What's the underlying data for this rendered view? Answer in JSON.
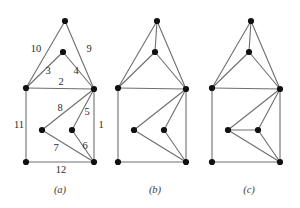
{
  "figure": {
    "type": "diagram",
    "background": "#ffffff",
    "edge_color": "#6e6e6e",
    "node_color": "#111111",
    "label_color": "#2b2b2b",
    "width": 300,
    "height": 208
  },
  "panels": [
    {
      "caption": "(a)",
      "caption_x": 60,
      "caption_y": 193,
      "origin_x": 0,
      "vertices": [
        {
          "name": "apex",
          "x": 65,
          "y": 21
        },
        {
          "name": "inner-top",
          "x": 63,
          "y": 52
        },
        {
          "name": "square-tl",
          "x": 26,
          "y": 88
        },
        {
          "name": "square-tr",
          "x": 94,
          "y": 89
        },
        {
          "name": "inner-left",
          "x": 42,
          "y": 130
        },
        {
          "name": "inner-right",
          "x": 72,
          "y": 130
        },
        {
          "name": "square-bl",
          "x": 26,
          "y": 162
        },
        {
          "name": "square-br",
          "x": 94,
          "y": 162
        }
      ],
      "edges": [
        {
          "from": "apex",
          "to": "square-tl",
          "label": "10",
          "lx": 36,
          "ly": 50
        },
        {
          "from": "apex",
          "to": "square-tr",
          "label": "9",
          "lx": 89,
          "ly": 50
        },
        {
          "from": "inner-top",
          "to": "square-tl",
          "label": "3",
          "lx": 48,
          "ly": 72
        },
        {
          "from": "inner-top",
          "to": "square-tr",
          "label": "4",
          "lx": 76,
          "ly": 72
        },
        {
          "from": "square-tl",
          "to": "square-tr",
          "label": "2",
          "lx": 61,
          "ly": 83
        },
        {
          "from": "square-tl",
          "to": "square-bl",
          "label": "11",
          "lx": 19,
          "ly": 126
        },
        {
          "from": "square-tr",
          "to": "square-br",
          "label": "1",
          "lx": 101,
          "ly": 126
        },
        {
          "from": "square-bl",
          "to": "square-br",
          "label": "12",
          "lx": 61,
          "ly": 171
        },
        {
          "from": "square-tr",
          "to": "inner-left",
          "label": "8",
          "lx": 60,
          "ly": 109
        },
        {
          "from": "square-tr",
          "to": "inner-right",
          "label": "5",
          "lx": 87,
          "ly": 113
        },
        {
          "from": "square-br",
          "to": "inner-right",
          "label": "6",
          "lx": 85,
          "ly": 147
        },
        {
          "from": "square-br",
          "to": "inner-left",
          "label": "7",
          "lx": 56,
          "ly": 149
        }
      ]
    },
    {
      "caption": "(b)",
      "caption_x": 155,
      "caption_y": 193,
      "origin_x": 92,
      "vertices": [
        {
          "name": "apex",
          "x": 65,
          "y": 21
        },
        {
          "name": "inner-top",
          "x": 63,
          "y": 52
        },
        {
          "name": "square-tl",
          "x": 26,
          "y": 88
        },
        {
          "name": "square-tr",
          "x": 94,
          "y": 89
        },
        {
          "name": "inner-left",
          "x": 42,
          "y": 130
        },
        {
          "name": "inner-right",
          "x": 72,
          "y": 130
        },
        {
          "name": "square-bl",
          "x": 26,
          "y": 162
        },
        {
          "name": "square-br",
          "x": 94,
          "y": 162
        }
      ],
      "edges": [
        {
          "from": "apex",
          "to": "square-tl",
          "label": "",
          "lx": 0,
          "ly": 0
        },
        {
          "from": "apex",
          "to": "square-tr",
          "label": "",
          "lx": 0,
          "ly": 0
        },
        {
          "from": "apex",
          "to": "inner-top",
          "label": "",
          "lx": 0,
          "ly": 0
        },
        {
          "from": "inner-top",
          "to": "square-tl",
          "label": "",
          "lx": 0,
          "ly": 0
        },
        {
          "from": "inner-top",
          "to": "square-tr",
          "label": "",
          "lx": 0,
          "ly": 0
        },
        {
          "from": "square-tl",
          "to": "square-tr",
          "label": "",
          "lx": 0,
          "ly": 0
        },
        {
          "from": "square-tl",
          "to": "square-bl",
          "label": "",
          "lx": 0,
          "ly": 0
        },
        {
          "from": "square-tr",
          "to": "square-br",
          "label": "",
          "lx": 0,
          "ly": 0
        },
        {
          "from": "square-bl",
          "to": "square-br",
          "label": "",
          "lx": 0,
          "ly": 0
        },
        {
          "from": "square-tr",
          "to": "inner-left",
          "label": "",
          "lx": 0,
          "ly": 0
        },
        {
          "from": "square-tr",
          "to": "inner-right",
          "label": "",
          "lx": 0,
          "ly": 0
        },
        {
          "from": "square-br",
          "to": "inner-right",
          "label": "",
          "lx": 0,
          "ly": 0
        },
        {
          "from": "square-br",
          "to": "inner-left",
          "label": "",
          "lx": 0,
          "ly": 0
        }
      ]
    },
    {
      "caption": "(c)",
      "caption_x": 249,
      "caption_y": 193,
      "origin_x": 186,
      "vertices": [
        {
          "name": "apex",
          "x": 65,
          "y": 21
        },
        {
          "name": "inner-top",
          "x": 63,
          "y": 52
        },
        {
          "name": "square-tl",
          "x": 26,
          "y": 88
        },
        {
          "name": "square-tr",
          "x": 94,
          "y": 89
        },
        {
          "name": "inner-left",
          "x": 42,
          "y": 130
        },
        {
          "name": "inner-right",
          "x": 72,
          "y": 130
        },
        {
          "name": "square-bl",
          "x": 26,
          "y": 162
        },
        {
          "name": "square-br",
          "x": 94,
          "y": 162
        }
      ],
      "edges": [
        {
          "from": "apex",
          "to": "square-tl",
          "label": "",
          "lx": 0,
          "ly": 0
        },
        {
          "from": "apex",
          "to": "square-tr",
          "label": "",
          "lx": 0,
          "ly": 0
        },
        {
          "from": "apex",
          "to": "inner-top",
          "label": "",
          "lx": 0,
          "ly": 0
        },
        {
          "from": "inner-top",
          "to": "square-tl",
          "label": "",
          "lx": 0,
          "ly": 0
        },
        {
          "from": "inner-top",
          "to": "square-tr",
          "label": "",
          "lx": 0,
          "ly": 0
        },
        {
          "from": "square-tl",
          "to": "square-tr",
          "label": "",
          "lx": 0,
          "ly": 0
        },
        {
          "from": "square-tl",
          "to": "square-bl",
          "label": "",
          "lx": 0,
          "ly": 0
        },
        {
          "from": "square-tr",
          "to": "square-br",
          "label": "",
          "lx": 0,
          "ly": 0
        },
        {
          "from": "square-bl",
          "to": "square-br",
          "label": "",
          "lx": 0,
          "ly": 0
        },
        {
          "from": "square-tr",
          "to": "inner-left",
          "label": "",
          "lx": 0,
          "ly": 0
        },
        {
          "from": "square-tr",
          "to": "inner-right",
          "label": "",
          "lx": 0,
          "ly": 0
        },
        {
          "from": "square-br",
          "to": "inner-right",
          "label": "",
          "lx": 0,
          "ly": 0
        },
        {
          "from": "square-br",
          "to": "inner-left",
          "label": "",
          "lx": 0,
          "ly": 0
        },
        {
          "from": "inner-left",
          "to": "inner-right",
          "label": "",
          "lx": 0,
          "ly": 0
        }
      ]
    }
  ]
}
